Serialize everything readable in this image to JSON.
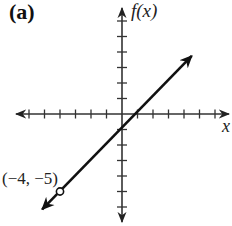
{
  "panel": {
    "label": "(a)"
  },
  "axes": {
    "xlabel": "x",
    "ylabel": "f(x)"
  },
  "chart_data": {
    "type": "line",
    "title": "(a)",
    "xlabel": "x",
    "ylabel": "f(x)",
    "function": "f(x) = x - 1",
    "xlim": [
      -7,
      7
    ],
    "ylim": [
      -7,
      7
    ],
    "tick_spacing": 1,
    "ticks_labeled": false,
    "grid": false,
    "series": [
      {
        "name": "f(x)",
        "x": [
          -4,
          4.5
        ],
        "y": [
          -5,
          3.5
        ],
        "left_end": {
          "x": -4,
          "y": -5,
          "marker": "open-circle",
          "note": "line continues with arrow past open point"
        },
        "right_end": {
          "marker": "arrow"
        }
      }
    ],
    "annotations": [
      {
        "text": "(−4, −5)",
        "x": -4,
        "y": -5
      }
    ],
    "legend": null
  },
  "annotations": {
    "point_label": "(−4, −5)"
  }
}
